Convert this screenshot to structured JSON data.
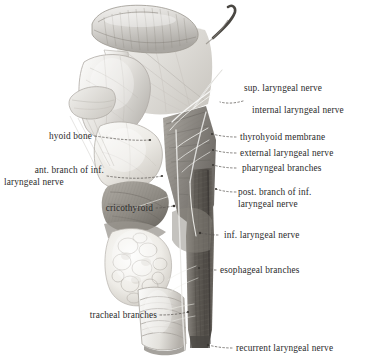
{
  "figure": {
    "background_color": "#ffffff",
    "label_color": "#2b2b2b",
    "medium": "pencil/graphite anatomical drawing"
  },
  "labels": {
    "sup_laryngeal_nerve": "sup. laryngeal nerve",
    "internal_laryngeal_nerve": "internal laryngeal nerve",
    "thyrohyoid_membrane": "thyrohyoid membrane",
    "external_laryngeal_nerve": "external laryngeal nerve",
    "pharyngeal_branches": "pharyngeal branches",
    "post_branch_line1": "post. branch of inf.",
    "post_branch_line2": "laryngeal nerve",
    "inf_laryngeal_nerve": "inf. laryngeal nerve",
    "esophageal_branches": "esophageal branches",
    "recurrent_laryngeal_nerve": "recurrent laryngeal nerve",
    "hyoid_bone": "hyoid bone",
    "ant_branch_line1": "ant. branch of inf.",
    "ant_branch_line2": "laryngeal nerve",
    "cricothyroid": "cricothyroid",
    "tracheal_branches": "tracheal branches"
  },
  "structures": [
    {
      "name": "epiglottis",
      "region": "superior, leaf-shaped cartilage"
    },
    {
      "name": "hyoid-bone",
      "region": "upper left of larynx"
    },
    {
      "name": "thyrohyoid-membrane",
      "region": "between hyoid and thyroid cartilage"
    },
    {
      "name": "thyroid-cartilage",
      "region": "mid larynx, lamina"
    },
    {
      "name": "cricothyroid-muscle",
      "region": "lower larynx, anterolateral"
    },
    {
      "name": "thyroid-gland",
      "region": "lobulated mass over upper trachea"
    },
    {
      "name": "trachea",
      "region": "inferior, cartilage rings"
    },
    {
      "name": "pharyngeal-constrictor",
      "region": "dark muscle sheet, right side"
    },
    {
      "name": "esophagus-nerve-column",
      "region": "dark vertical band, right"
    }
  ]
}
